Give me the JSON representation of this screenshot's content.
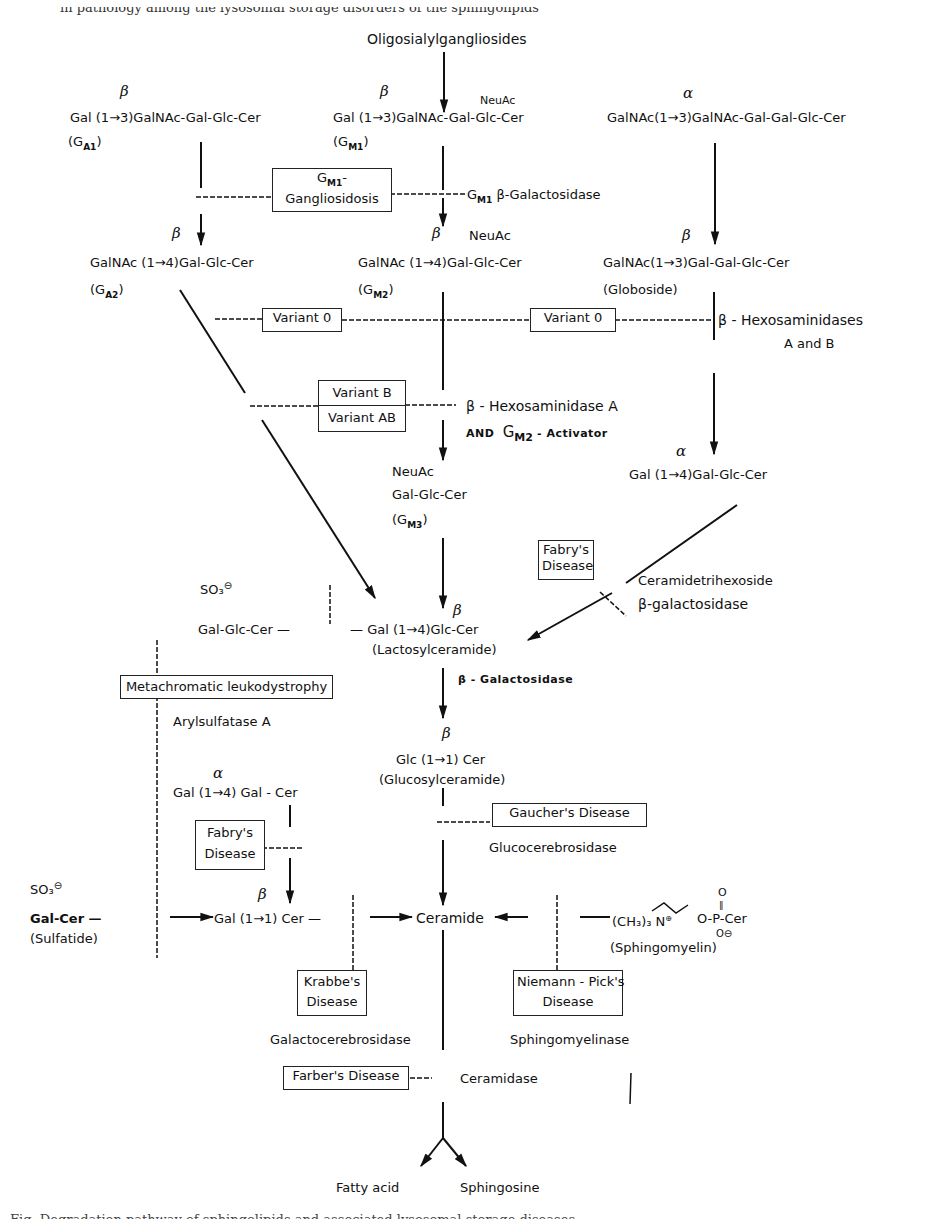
{
  "top_cut_text": "in pathology among the lysosomal storage disorders of the sphingolipids",
  "bottom_cut_text": "Fig. Degradation pathway of sphingolipids and associated lysosomal storage diseases",
  "nodes": {
    "oligosialylgangliosides": "Oligosialylgangliosides",
    "sialidase": "SIALIDASE",
    "ga1": {
      "anomer": "β",
      "formula": "Gal (1→3)GalNAc-Gal-Glc-Cer",
      "name": "(G",
      "sub": "A1",
      "close": ")"
    },
    "gm1": {
      "anomer": "β",
      "formula": "Gal (1→3)GalNAc-Gal-Glc-Cer",
      "branch": "NeuAc",
      "name": "(G",
      "sub": "M1",
      "close": ")"
    },
    "globo_precursor": {
      "anomer": "α",
      "formula": "GalNAc(1→3)GalNAc-Gal-Gal-Glc-Cer"
    },
    "ga2": {
      "anomer": "β",
      "formula": "GalNAc (1→4)Gal-Glc-Cer",
      "name": "(G",
      "sub": "A2",
      "close": ")"
    },
    "gm2": {
      "anomer": "β",
      "formula": "GalNAc (1→4)Gal-Glc-Cer",
      "branch": "NeuAc",
      "name": "(G",
      "sub": "M2",
      "close": ")"
    },
    "globoside": {
      "anomer": "β",
      "formula": "GalNAc(1→3)Gal-Gal-Glc-Cer",
      "name": "(Globoside)"
    },
    "gm3": {
      "branch": "NeuAc",
      "formula": "Gal-Glc-Cer",
      "name": "(G",
      "sub": "M3",
      "close": ")"
    },
    "ceramide_trihexoside": {
      "anomer": "α",
      "formula": "Gal (1→4)Gal-Glc-Cer"
    },
    "sulfo_lactosyl": {
      "group": "SO₃",
      "charge": "⊖",
      "formula": "Gal-Glc-Cer —"
    },
    "lactosylceramide": {
      "anomer": "β",
      "formula": "— Gal (1→4)Glc-Cer",
      "name": "(Lactosylceramide)"
    },
    "glucosylceramide": {
      "anomer": "β",
      "formula": "Glc (1→1) Cer",
      "name": "(Glucosylceramide)"
    },
    "digalactosylceramide": {
      "anomer": "α",
      "formula": "Gal (1→4) Gal - Cer"
    },
    "sulfatide": {
      "group": "SO₃",
      "charge": "⊖",
      "formula": "Gal-Cer —",
      "name": "(Sulfatide)"
    },
    "galactosylceramide": {
      "anomer": "β",
      "formula": "Gal (1→1) Cer —"
    },
    "ceramide": "Ceramide",
    "sphingomyelin": {
      "formula": "(CH₃)₃ N",
      "charge": "⊕",
      "tail": "O-P-Cer",
      "oxo": "O",
      "oxo_bond": "‖",
      "neg_o": "O⊖",
      "name": "(Sphingomyelin)"
    },
    "fatty_acid": "Fatty acid",
    "sphingosine": "Sphingosine"
  },
  "enzymes": {
    "gm1_galactosidase": {
      "prefix": "G",
      "sub": "M1",
      "text": "β-Galactosidase"
    },
    "hexosaminidases_ab": {
      "line1": "β - Hexosaminidases",
      "line2": "A and B"
    },
    "hexosaminidase_a": {
      "line1": "β - Hexosaminidase A",
      "and": "AND",
      "g": "G",
      "sub": "M2",
      "activator": "- Activator"
    },
    "ceramidetrihexoside_galactosidase": {
      "line1": "Ceramidetrihexoside",
      "line2": "β-galactosidase"
    },
    "lactosyl_galactosidase": "β - Galactosidase",
    "arylsulfatase": "Arylsulfatase A",
    "glucocerebrosidase": "Glucocerebrosidase",
    "galactocerebrosidase": "Galactocerebrosidase",
    "sphingomyelinase": "Sphingomyelinase",
    "ceramidase": "Ceramidase"
  },
  "diseases": {
    "gm1_gangliosidosis": {
      "line1": "G",
      "sub": "M1",
      "line1b": "-",
      "line2": "Gangliosidosis"
    },
    "variant0_left": "Variant 0",
    "variant0_right": "Variant 0",
    "variant_b": "Variant B",
    "variant_ab": "Variant AB",
    "fabry_upper": {
      "line1": "Fabry's",
      "line2": "Disease"
    },
    "metachromatic": "Metachromatic leukodystrophy",
    "gaucher": "Gaucher's Disease",
    "fabry_lower": {
      "line1": "Fabry's",
      "line2": "Disease"
    },
    "krabbe": {
      "line1": "Krabbe's",
      "line2": "Disease"
    },
    "niemann_pick": {
      "line1": "Niemann - Pick's",
      "line2": "Disease"
    },
    "farber": "Farber's Disease"
  }
}
